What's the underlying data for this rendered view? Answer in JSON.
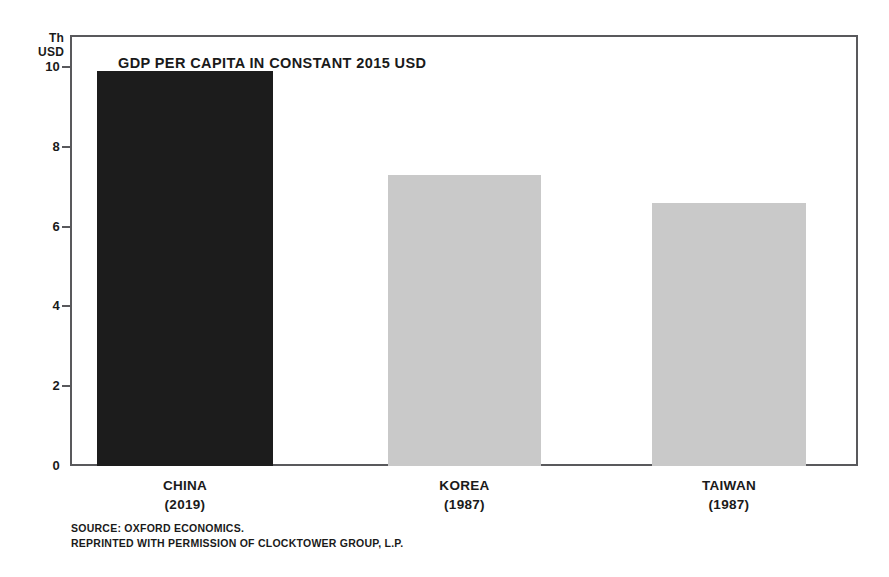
{
  "chart_data": {
    "type": "bar",
    "title": "GDP PER CAPITA IN CONSTANT 2015 USD",
    "xlabel": "",
    "ylabel": "Th USD",
    "ylim": [
      0,
      10.8
    ],
    "grid": false,
    "legend": null,
    "categories": [
      "CHINA",
      "KOREA",
      "TAIWAN"
    ],
    "category_years": [
      "(2019)",
      "(1987)",
      "(1987)"
    ],
    "values": [
      9.9,
      7.3,
      6.6
    ],
    "bar_colors": [
      "#1c1c1c",
      "#c9c9c9",
      "#c9c9c9"
    ],
    "yticks": [
      0,
      2,
      4,
      6,
      8,
      10
    ],
    "ytick_labels": [
      "0",
      "2",
      "4",
      "6",
      "8",
      "10"
    ],
    "annotations": [
      "SOURCE: OXFORD ECONOMICS.",
      "REPRINTED WITH PERMISSION OF CLOCKTOWER GROUP, L.P."
    ]
  },
  "axis_unit": {
    "line1": "Th",
    "line2": "USD"
  },
  "colors": {
    "frame": "#59595c",
    "text": "#1a1a1a",
    "background": "#ffffff",
    "bar_dark": "#1c1c1c",
    "bar_light": "#c9c9c9"
  },
  "source": {
    "line1": "SOURCE: OXFORD ECONOMICS.",
    "line2": "REPRINTED WITH PERMISSION OF CLOCKTOWER GROUP, L.P."
  }
}
